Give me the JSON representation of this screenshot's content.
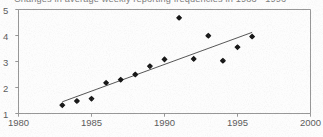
{
  "figure": {
    "title": "Changes in average weekly reporting frequencies in  1983 - 1996",
    "background_color": "#fdfdfd",
    "ink_color": "#4a4a4a",
    "marker_color": "#161616",
    "axis_color": "#8a8a8a"
  },
  "chart_data": {
    "type": "scatter",
    "title": "Changes in average weekly reporting frequencies in  1983 - 1996",
    "xlabel": "",
    "ylabel": "",
    "xlim": [
      1980,
      2000
    ],
    "ylim": [
      1,
      5
    ],
    "xticks": [
      1980,
      1985,
      1990,
      1995,
      2000
    ],
    "yticks": [
      1,
      2,
      3,
      4,
      5
    ],
    "xtick_labels": [
      "1980",
      "1985",
      "1990",
      "1995",
      "2000"
    ],
    "ytick_labels": [
      "1",
      "2",
      "3",
      "4",
      "5"
    ],
    "grid": false,
    "legend": null,
    "marker": "diamond",
    "x": [
      1983,
      1984,
      1985,
      1986,
      1987,
      1988,
      1989,
      1990,
      1991,
      1992,
      1993,
      1994,
      1995,
      1996
    ],
    "y": [
      1.32,
      1.48,
      1.57,
      2.18,
      2.3,
      2.5,
      2.82,
      3.08,
      4.68,
      3.1,
      3.99,
      3.03,
      3.55,
      3.96
    ],
    "series": [
      {
        "name": "Average weekly reporting frequency",
        "values": [
          1.32,
          1.48,
          1.57,
          2.18,
          2.3,
          2.5,
          2.82,
          3.08,
          4.68,
          3.1,
          3.99,
          3.03,
          3.55,
          3.96
        ]
      }
    ],
    "trendline": {
      "type": "linear-fit",
      "x": [
        1983,
        1996
      ],
      "y": [
        1.45,
        4.12
      ]
    },
    "annotations": [
      {
        "label": "outlier",
        "x": 1991,
        "y": 4.68
      }
    ]
  }
}
